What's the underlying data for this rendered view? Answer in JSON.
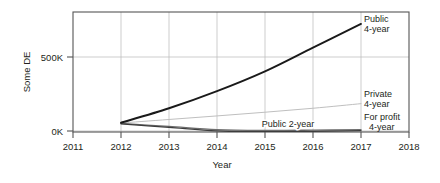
{
  "chart_data": {
    "type": "line",
    "title": "",
    "xlabel": "Year",
    "ylabel": "Some DE",
    "x": [
      2012,
      2013,
      2014,
      2015,
      2016,
      2017
    ],
    "xlim": [
      2011,
      2018
    ],
    "ylim": [
      -60000,
      850000
    ],
    "xticks": [
      "2011",
      "2012",
      "2013",
      "2014",
      "2015",
      "2016",
      "2017",
      "2018"
    ],
    "yticks": [
      "0K",
      "500K"
    ],
    "ytick_values": [
      0,
      500000
    ],
    "grid": true,
    "legend_position": "right-inline",
    "series": [
      {
        "name": "Public 4-year",
        "label": "Public",
        "label2": "4-year",
        "color": "#1a1a1a",
        "width": 1.9,
        "values": [
          10000,
          120000,
          250000,
          400000,
          580000,
          760000
        ]
      },
      {
        "name": "Private 4-year",
        "label": "Private",
        "label2": "4-year",
        "color": "#bfbfbf",
        "width": 1.0,
        "values": [
          8000,
          35000,
          62000,
          90000,
          120000,
          155000
        ]
      },
      {
        "name": "Public 2-year",
        "label": "Public 2-year",
        "label2": "",
        "color": "#6e6e6e",
        "width": 1.3,
        "values": [
          5000,
          -18000,
          -42000,
          -48000,
          -46000,
          -42000
        ]
      },
      {
        "name": "For profit 4-year",
        "label": "For profit",
        "label2": "4-year",
        "color": "#3d3d3d",
        "width": 1.3,
        "values": [
          2000,
          -25000,
          -52000,
          -58000,
          -55000,
          -50000
        ]
      }
    ],
    "annotations": {
      "public4_label_line1": "Public",
      "public4_label_line2": "4-year",
      "private4_label_line1": "Private",
      "private4_label_line2": "4-year",
      "forprofit_label_line1": "For profit",
      "forprofit_label_line2": "4-year",
      "public2_label": "Public 2-year"
    }
  }
}
